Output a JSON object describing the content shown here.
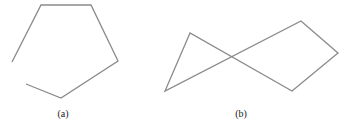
{
  "figures": [
    {
      "label": "(a)",
      "label_pos": [
        63,
        108
      ],
      "description": "open hexagon-like polygon (gap between first and last vertex)",
      "closed": false,
      "points": [
        [
          12,
          62
        ],
        [
          41,
          5
        ],
        [
          91,
          5
        ],
        [
          118,
          61
        ],
        [
          61,
          98
        ],
        [
          26,
          84
        ]
      ]
    },
    {
      "label": "(b)",
      "label_pos": [
        241,
        108
      ],
      "description": "self-intersecting closed polygon (bow-tie shape)",
      "closed": true,
      "points": [
        [
          190,
          33
        ],
        [
          165,
          91
        ],
        [
          301,
          21
        ],
        [
          338,
          53
        ],
        [
          292,
          91
        ]
      ]
    }
  ],
  "stroke_color": "#8a8a8a"
}
